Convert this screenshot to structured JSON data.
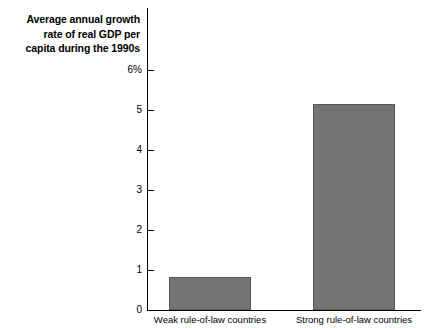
{
  "chart_data": {
    "type": "bar",
    "title": "Average annual growth\nrate of real GDP per\ncapita during the 1990s",
    "xlabel": "",
    "ylabel": "",
    "categories": [
      "Weak rule-of-law countries",
      "Strong rule-of-law countries"
    ],
    "values": [
      0.82,
      5.15
    ],
    "ylim": [
      0,
      6
    ],
    "yticks": [
      0,
      1,
      2,
      3,
      4,
      5,
      6
    ],
    "ytick_labels": [
      "0",
      "1",
      "2",
      "3",
      "4",
      "5",
      "6%"
    ],
    "grid": false,
    "legend": false,
    "bar_color": "#737373",
    "bar_border_color": "#595959",
    "axis_color": "#000000",
    "background_color": "#ffffff"
  }
}
